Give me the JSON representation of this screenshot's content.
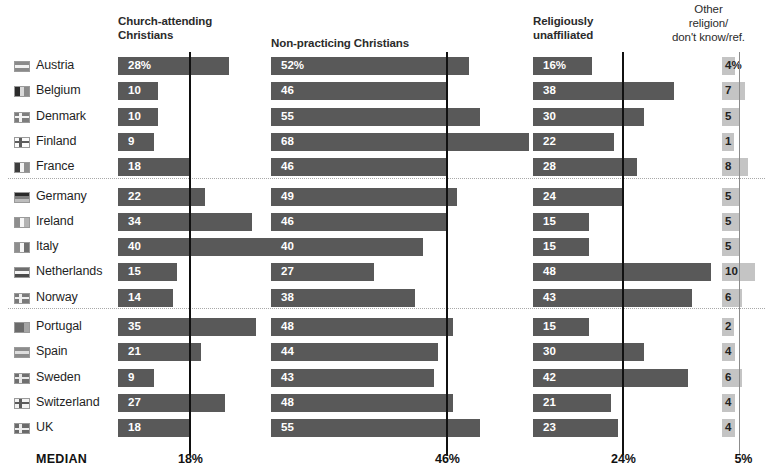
{
  "chart_data": {
    "type": "bar",
    "title": "",
    "subtitle": "",
    "xlabel": "",
    "ylabel": "",
    "orientation": "horizontal",
    "grid": false,
    "legend_position": "top (column headers)",
    "note": "Grouped horizontal bar chart, four value columns per country; each column has its own median reference line.",
    "categories": [
      "Austria",
      "Belgium",
      "Denmark",
      "Finland",
      "France",
      "Germany",
      "Ireland",
      "Italy",
      "Netherlands",
      "Norway",
      "Portugal",
      "Spain",
      "Sweden",
      "Switzerland",
      "UK"
    ],
    "series": [
      {
        "name": "Church-attending Christians",
        "median": 18,
        "median_label": "18%",
        "axis_max": 70,
        "values": [
          28,
          10,
          10,
          9,
          18,
          22,
          34,
          40,
          15,
          14,
          35,
          21,
          9,
          27,
          18
        ]
      },
      {
        "name": "Non-practicing Christians",
        "median": 46,
        "median_label": "46%",
        "axis_max": 70,
        "values": [
          52,
          46,
          55,
          68,
          46,
          49,
          46,
          40,
          27,
          38,
          48,
          44,
          43,
          48,
          55
        ]
      },
      {
        "name": "Religiously unaffiliated",
        "median": 24,
        "median_label": "24%",
        "axis_max": 70,
        "values": [
          16,
          38,
          30,
          22,
          28,
          24,
          15,
          15,
          48,
          43,
          15,
          30,
          42,
          21,
          23
        ]
      },
      {
        "name": "Other religion/ don't know/ref.",
        "median": 5,
        "median_label": "5%",
        "axis_max": 12,
        "values": [
          4,
          7,
          5,
          1,
          8,
          5,
          5,
          5,
          10,
          6,
          2,
          4,
          6,
          4,
          4
        ]
      }
    ],
    "first_row_suffix": "%",
    "group_separators_after": [
      "France",
      "Norway"
    ]
  },
  "headers": {
    "col0": "Church-attending\nChristians",
    "col0_line1": "Church-attending",
    "col0_line2": "Christians",
    "col1": "Non-practicing Christians",
    "col2_line1": "Religiously",
    "col2_line2": "unaffiliated",
    "col3_line1": "Other",
    "col3_line2": "religion/",
    "col3_line3": "don't know/ref."
  },
  "footer": {
    "median_label": "MEDIAN",
    "values": [
      "18%",
      "46%",
      "24%",
      "5%"
    ]
  },
  "colors": {
    "bar_dark": "#595959",
    "bar_light": "#c4c4c4",
    "median_line": "#111111",
    "background": "#ffffff",
    "text": "#1a1a1a",
    "separator": "#a8a8a8"
  },
  "flags": {
    "Austria": "flag-austria-icon",
    "Belgium": "flag-belgium-icon",
    "Denmark": "flag-denmark-icon",
    "Finland": "flag-finland-icon",
    "France": "flag-france-icon",
    "Germany": "flag-germany-icon",
    "Ireland": "flag-ireland-icon",
    "Italy": "flag-italy-icon",
    "Netherlands": "flag-netherlands-icon",
    "Norway": "flag-norway-icon",
    "Portugal": "flag-portugal-icon",
    "Spain": "flag-spain-icon",
    "Sweden": "flag-sweden-icon",
    "Switzerland": "flag-switzerland-icon",
    "UK": "flag-uk-icon"
  }
}
